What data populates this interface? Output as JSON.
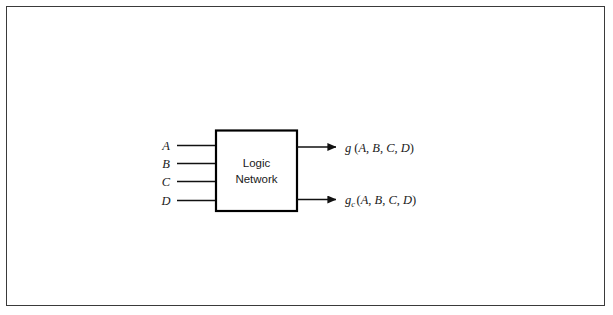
{
  "figure": {
    "type": "block-diagram",
    "background_color": "#ffffff",
    "frame": {
      "name": "figure-border",
      "color": "#3a3a3a",
      "visible": true
    },
    "block": {
      "name": "logic-network-block",
      "label_line1": "Logic",
      "label_line2": "Network",
      "border_color": "#000000",
      "fill_color": "#ffffff"
    },
    "inputs": [
      {
        "label": "A",
        "name": "input-a"
      },
      {
        "label": "B",
        "name": "input-b"
      },
      {
        "label": "C",
        "name": "input-c"
      },
      {
        "label": "D",
        "name": "input-d"
      }
    ],
    "outputs": [
      {
        "name": "output-g",
        "func": "g",
        "subscript": "",
        "args": "(A, B, C, D)",
        "full_text": "g (A, B, C, D)"
      },
      {
        "name": "output-gc",
        "func": "g",
        "subscript": "c",
        "args": "(A, B, C, D)",
        "full_text": "g c (A, B, C, D)"
      }
    ],
    "arg_parts": {
      "open": "(",
      "a": "A",
      "comma1": ", ",
      "b": "B",
      "comma2": ", ",
      "c": "C",
      "comma3": ", ",
      "d": "D",
      "close": ")"
    }
  }
}
